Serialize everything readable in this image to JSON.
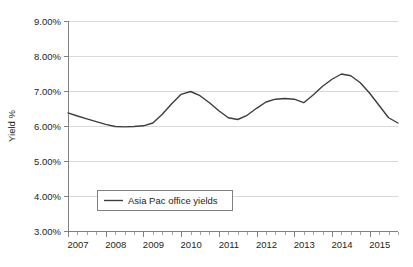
{
  "chart_data": {
    "type": "line",
    "title": "",
    "subtitle": "",
    "xlabel": "",
    "ylabel": "Yield %",
    "ylim": [
      3.0,
      9.0
    ],
    "ytick_labels": [
      "9.00%",
      "8.00%",
      "7.00%",
      "6.00%",
      "5.00%",
      "4.00%",
      "3.00%"
    ],
    "ytick_values": [
      9.0,
      8.0,
      7.0,
      6.0,
      5.0,
      4.0,
      3.0
    ],
    "xtick_labels": [
      "2007",
      "2008",
      "2009",
      "2010",
      "2011",
      "2012",
      "2013",
      "2014",
      "2015"
    ],
    "xtick_values": [
      2007,
      2008,
      2009,
      2010,
      2011,
      2012,
      2013,
      2014,
      2015
    ],
    "xlim": [
      2007,
      2015.75
    ],
    "x_minor_interval_years": 0.25,
    "grid": "horizontal",
    "legend_position": "inside-bottom-left",
    "legend": [
      "Asia Pac office yields"
    ],
    "line_color": "#3d3d3d",
    "grid_color": "#d9d9d9",
    "axis_color": "#808080",
    "series": [
      {
        "name": "Asia Pac office yields",
        "x": [
          2007.0,
          2007.25,
          2007.5,
          2007.75,
          2008.0,
          2008.25,
          2008.5,
          2008.75,
          2009.0,
          2009.25,
          2009.5,
          2009.75,
          2010.0,
          2010.25,
          2010.5,
          2010.75,
          2011.0,
          2011.25,
          2011.5,
          2011.75,
          2012.0,
          2012.25,
          2012.5,
          2012.75,
          2013.0,
          2013.25,
          2013.5,
          2013.75,
          2014.0,
          2014.25,
          2014.5,
          2014.75,
          2015.0,
          2015.25,
          2015.5,
          2015.75
        ],
        "values": [
          6.39,
          6.3,
          6.22,
          6.14,
          6.06,
          6.0,
          5.99,
          6.0,
          6.02,
          6.1,
          6.35,
          6.65,
          6.92,
          7.0,
          6.88,
          6.68,
          6.45,
          6.25,
          6.2,
          6.32,
          6.52,
          6.7,
          6.78,
          6.8,
          6.78,
          6.68,
          6.9,
          7.15,
          7.35,
          7.5,
          7.45,
          7.25,
          6.95,
          6.6,
          6.25,
          6.1
        ],
        "label_first": "6.39%",
        "label_min": "5.99%",
        "label_max": "7.50%",
        "label_last": "6.18%"
      }
    ],
    "annotations": []
  },
  "legend": {
    "entry_label": "Asia Pac office yields"
  },
  "axes": {
    "y_title": "Yield %"
  }
}
